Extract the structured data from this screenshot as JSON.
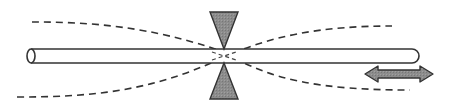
{
  "diagram": {
    "title": "Fiber drawn through focused beam waist",
    "colors": {
      "background": "#ffffff",
      "stroke": "#333333",
      "cone_fill": "#8a8a8a",
      "arrow_fill": "#9a9a9a",
      "dash": "#333333"
    },
    "elements": {
      "rod": "fiber-rod",
      "top_cone": "focusing-cone-top",
      "bottom_cone": "focusing-cone-bottom",
      "dashed_envelope": "beam-envelope",
      "arrow": "translation-double-arrow"
    }
  }
}
